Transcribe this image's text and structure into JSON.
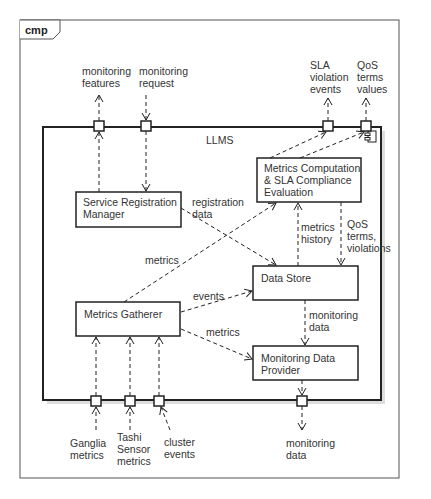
{
  "frame": {
    "tab_label": "cmp"
  },
  "component": {
    "name": "LLMS"
  },
  "components": [
    {
      "id": "srm",
      "label": "Service Registration\nManager"
    },
    {
      "id": "mcse",
      "label": "Metrics Computation\n& SLA Compliance\nEvaluation"
    },
    {
      "id": "ds",
      "label": "Data Store"
    },
    {
      "id": "mg",
      "label": "Metrics Gatherer"
    },
    {
      "id": "mdp",
      "label": "Monitoring Data\nProvider"
    }
  ],
  "external_labels": {
    "monitoring_features": "monitoring\nfeatures",
    "monitoring_request": "monitoring\nrequest",
    "sla_violation_events": "SLA\nviolation\nevents",
    "qos_terms_values": "QoS\nterms\nvalues",
    "ganglia_metrics": "Ganglia\nmetrics",
    "tashi_sensor_metrics": "Tashi\nSensor\nmetrics",
    "cluster_events": "cluster\nevents",
    "monitoring_data_out": "monitoring\ndata"
  },
  "edge_labels": {
    "registration_data": "registration\ndata",
    "metrics_to_mcse": "metrics",
    "events": "events",
    "metrics_to_mdp": "metrics",
    "metrics_history": "metrics\nhistory",
    "qos_terms_violations": "QoS\nterms,\nviolations",
    "monitoring_data_internal": "monitoring\ndata"
  },
  "colors": {
    "line": "#222222",
    "frame": "#555555",
    "shadow": "#bbbbbb",
    "text": "#333333"
  }
}
